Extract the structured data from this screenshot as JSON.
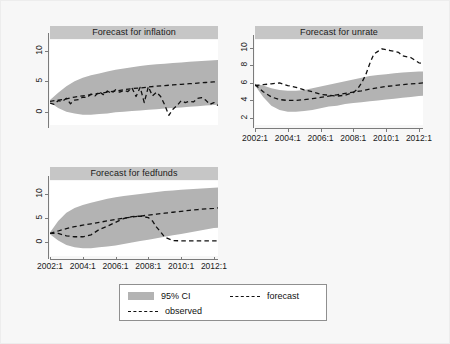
{
  "figure": {
    "background": "#f7f7f7",
    "panel_background": "#ffffff",
    "strip_background": "#c6c6c6",
    "ci_color": "#b3b3b3",
    "line_color": "#111111"
  },
  "legend": {
    "items": [
      {
        "label": "95% CI",
        "style": "band",
        "color": "#b3b3b3"
      },
      {
        "label": "forecast",
        "style": "dashed",
        "color": "#111111"
      },
      {
        "label": "observed",
        "style": "dashed",
        "color": "#111111"
      }
    ]
  },
  "chart_data": [
    {
      "type": "line",
      "title": "Forecast for inflation",
      "xlabel": "",
      "ylabel": "",
      "xlim": [
        2002.0,
        2012.25
      ],
      "ylim": [
        -2.2,
        11.8
      ],
      "yticks": [
        0,
        5,
        10
      ],
      "ytick_labels": [
        "0",
        "5",
        "10"
      ],
      "xticks": [],
      "xtick_labels": [],
      "grid": false,
      "series": [
        {
          "name": "95% CI",
          "type": "band",
          "x": [
            2002.0,
            2002.5,
            2003.0,
            2003.5,
            2004.0,
            2004.5,
            2005.0,
            2005.5,
            2006.0,
            2006.5,
            2007.0,
            2007.5,
            2008.0,
            2008.5,
            2009.0,
            2009.5,
            2010.0,
            2010.5,
            2011.0,
            2011.5,
            2012.0,
            2012.25
          ],
          "lower": [
            1.5,
            0.6,
            0.0,
            -0.3,
            -0.5,
            -0.5,
            -0.4,
            -0.3,
            -0.1,
            0.0,
            0.1,
            0.2,
            0.3,
            0.4,
            0.5,
            0.6,
            0.7,
            0.8,
            0.9,
            1.0,
            1.1,
            1.15
          ],
          "upper": [
            1.9,
            3.1,
            4.2,
            5.0,
            5.6,
            6.0,
            6.3,
            6.6,
            6.9,
            7.1,
            7.3,
            7.5,
            7.7,
            7.8,
            7.9,
            8.0,
            8.1,
            8.2,
            8.3,
            8.4,
            8.45,
            8.5
          ]
        },
        {
          "name": "forecast",
          "type": "dashed",
          "x": [
            2002.0,
            2002.5,
            2003.0,
            2003.5,
            2004.0,
            2004.5,
            2005.0,
            2005.5,
            2006.0,
            2006.5,
            2007.0,
            2007.5,
            2008.0,
            2008.5,
            2009.0,
            2009.5,
            2010.0,
            2010.5,
            2011.0,
            2011.5,
            2012.0,
            2012.25
          ],
          "y": [
            1.7,
            1.9,
            2.1,
            2.4,
            2.6,
            2.8,
            3.0,
            3.2,
            3.4,
            3.6,
            3.8,
            3.9,
            4.05,
            4.2,
            4.3,
            4.4,
            4.5,
            4.6,
            4.7,
            4.8,
            4.9,
            4.95
          ]
        },
        {
          "name": "observed",
          "type": "dashed",
          "x": [
            2002.0,
            2002.25,
            2002.5,
            2002.75,
            2003.0,
            2003.25,
            2003.5,
            2003.75,
            2004.0,
            2004.25,
            2004.5,
            2004.75,
            2005.0,
            2005.25,
            2005.5,
            2005.75,
            2006.0,
            2006.25,
            2006.5,
            2006.75,
            2007.0,
            2007.25,
            2007.5,
            2007.75,
            2008.0,
            2008.25,
            2008.5,
            2008.75,
            2009.0,
            2009.25,
            2009.5,
            2009.75,
            2010.0,
            2010.25,
            2010.5,
            2010.75,
            2011.0,
            2011.25,
            2011.5,
            2011.75,
            2012.0,
            2012.25
          ],
          "y": [
            1.4,
            1.2,
            1.8,
            1.7,
            2.2,
            1.3,
            1.9,
            2.0,
            2.4,
            2.3,
            2.9,
            2.6,
            3.3,
            2.8,
            3.4,
            3.0,
            3.6,
            3.2,
            3.5,
            3.3,
            3.9,
            2.5,
            4.0,
            1.5,
            4.1,
            2.6,
            3.2,
            2.5,
            1.1,
            -0.6,
            0.4,
            1.0,
            1.8,
            1.5,
            1.7,
            1.6,
            2.2,
            2.3,
            1.9,
            1.2,
            1.5,
            1.0
          ]
        }
      ]
    },
    {
      "type": "line",
      "title": "Forecast for unrate",
      "xlabel": "",
      "ylabel": "",
      "xlim": [
        2002.0,
        2012.25
      ],
      "ylim": [
        1.2,
        10.9
      ],
      "yticks": [
        2,
        4,
        6,
        8,
        10
      ],
      "ytick_labels": [
        "2",
        "4",
        "6",
        "8",
        "10"
      ],
      "xticks": [
        2002,
        2004,
        2006,
        2008,
        2010,
        2012
      ],
      "xtick_labels": [
        "2002:1",
        "2004:1",
        "2006:1",
        "2008:1",
        "2010:1",
        "2012:1"
      ],
      "grid": false,
      "series": [
        {
          "name": "95% CI",
          "type": "band",
          "x": [
            2002.0,
            2002.5,
            2003.0,
            2003.5,
            2004.0,
            2004.5,
            2005.0,
            2005.5,
            2006.0,
            2006.5,
            2007.0,
            2007.5,
            2008.0,
            2008.5,
            2009.0,
            2009.5,
            2010.0,
            2010.5,
            2011.0,
            2011.5,
            2012.0,
            2012.25
          ],
          "lower": [
            5.7,
            4.4,
            3.4,
            2.9,
            2.7,
            2.7,
            2.8,
            2.9,
            3.1,
            3.3,
            3.4,
            3.6,
            3.7,
            3.8,
            3.9,
            4.0,
            4.1,
            4.2,
            4.3,
            4.4,
            4.5,
            4.55
          ],
          "upper": [
            5.9,
            5.7,
            5.4,
            5.2,
            5.1,
            5.1,
            5.2,
            5.4,
            5.6,
            5.8,
            6.0,
            6.2,
            6.4,
            6.6,
            6.8,
            6.9,
            7.0,
            7.1,
            7.2,
            7.25,
            7.3,
            7.3
          ]
        },
        {
          "name": "forecast",
          "type": "dashed",
          "x": [
            2002.0,
            2002.5,
            2003.0,
            2003.5,
            2004.0,
            2004.5,
            2005.0,
            2005.5,
            2006.0,
            2006.5,
            2007.0,
            2007.5,
            2008.0,
            2008.5,
            2009.0,
            2009.5,
            2010.0,
            2010.5,
            2011.0,
            2011.5,
            2012.0,
            2012.25
          ],
          "y": [
            5.8,
            5.0,
            4.4,
            4.1,
            4.0,
            4.0,
            4.1,
            4.2,
            4.35,
            4.5,
            4.65,
            4.8,
            4.95,
            5.1,
            5.3,
            5.45,
            5.6,
            5.7,
            5.8,
            5.9,
            5.95,
            6.0
          ]
        },
        {
          "name": "observed",
          "type": "dashed",
          "x": [
            2002.0,
            2002.5,
            2003.0,
            2003.5,
            2004.0,
            2004.5,
            2005.0,
            2005.5,
            2006.0,
            2006.5,
            2007.0,
            2007.5,
            2008.0,
            2008.25,
            2008.5,
            2008.75,
            2009.0,
            2009.25,
            2009.5,
            2009.75,
            2010.0,
            2010.25,
            2010.5,
            2010.75,
            2011.0,
            2011.5,
            2012.0,
            2012.25
          ],
          "y": [
            5.7,
            5.8,
            5.9,
            6.0,
            5.7,
            5.5,
            5.2,
            5.0,
            4.7,
            4.6,
            4.5,
            4.6,
            4.9,
            5.3,
            6.0,
            6.9,
            8.2,
            9.3,
            9.6,
            9.9,
            9.8,
            9.7,
            9.6,
            9.5,
            9.1,
            8.9,
            8.3,
            8.2
          ]
        }
      ]
    },
    {
      "type": "line",
      "title": "Forecast for fedfunds",
      "xlabel": "",
      "ylabel": "",
      "xlim": [
        2002.0,
        2012.25
      ],
      "ylim": [
        -3.0,
        12.6
      ],
      "yticks": [
        0,
        5,
        10
      ],
      "ytick_labels": [
        "0",
        "5",
        "10"
      ],
      "xticks": [
        2002,
        2004,
        2006,
        2008,
        2010,
        2012
      ],
      "xtick_labels": [
        "2002:1",
        "2004:1",
        "2006:1",
        "2008:1",
        "2010:1",
        "2012:1"
      ],
      "grid": false,
      "series": [
        {
          "name": "95% CI",
          "type": "band",
          "x": [
            2002.0,
            2002.5,
            2003.0,
            2003.5,
            2004.0,
            2004.5,
            2005.0,
            2005.5,
            2006.0,
            2006.5,
            2007.0,
            2007.5,
            2008.0,
            2008.5,
            2009.0,
            2009.5,
            2010.0,
            2010.5,
            2011.0,
            2011.5,
            2012.0,
            2012.25
          ],
          "lower": [
            1.5,
            0.2,
            -0.7,
            -1.2,
            -1.4,
            -1.4,
            -1.2,
            -1.0,
            -0.8,
            -0.5,
            -0.2,
            0.1,
            0.4,
            0.7,
            1.0,
            1.3,
            1.6,
            1.9,
            2.2,
            2.5,
            2.8,
            2.9
          ],
          "upper": [
            1.9,
            4.3,
            6.0,
            7.0,
            7.6,
            8.1,
            8.5,
            8.9,
            9.2,
            9.5,
            9.7,
            9.9,
            10.1,
            10.3,
            10.5,
            10.6,
            10.8,
            10.9,
            11.0,
            11.1,
            11.2,
            11.25
          ]
        },
        {
          "name": "forecast",
          "type": "dashed",
          "x": [
            2002.0,
            2002.5,
            2003.0,
            2003.5,
            2004.0,
            2004.5,
            2005.0,
            2005.5,
            2006.0,
            2006.5,
            2007.0,
            2007.5,
            2008.0,
            2008.5,
            2009.0,
            2009.5,
            2010.0,
            2010.5,
            2011.0,
            2011.5,
            2012.0,
            2012.25
          ],
          "y": [
            1.7,
            2.2,
            2.7,
            3.1,
            3.4,
            3.7,
            4.0,
            4.3,
            4.6,
            4.9,
            5.1,
            5.3,
            5.5,
            5.7,
            5.9,
            6.1,
            6.3,
            6.5,
            6.65,
            6.8,
            6.9,
            7.0
          ]
        },
        {
          "name": "observed",
          "type": "dashed",
          "x": [
            2002.0,
            2002.5,
            2003.0,
            2003.5,
            2004.0,
            2004.5,
            2005.0,
            2005.5,
            2006.0,
            2006.5,
            2007.0,
            2007.5,
            2008.0,
            2008.25,
            2008.5,
            2008.75,
            2009.0,
            2009.5,
            2010.0,
            2010.5,
            2011.0,
            2011.5,
            2012.0,
            2012.25
          ],
          "y": [
            1.7,
            1.7,
            1.2,
            1.0,
            1.0,
            1.4,
            2.5,
            3.2,
            4.0,
            4.8,
            5.2,
            5.3,
            5.0,
            4.3,
            3.0,
            2.0,
            0.9,
            0.2,
            0.15,
            0.15,
            0.15,
            0.15,
            0.15,
            0.15
          ]
        }
      ]
    }
  ]
}
